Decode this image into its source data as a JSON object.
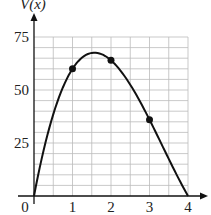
{
  "chart_data": {
    "type": "line",
    "title": "",
    "xlabel": "",
    "ylabel": "V(x)",
    "x_ticks": [
      "0",
      "1",
      "2",
      "3",
      "4"
    ],
    "y_ticks": [
      "25",
      "50",
      "75"
    ],
    "xlim": [
      0,
      4
    ],
    "ylim": [
      0,
      75
    ],
    "grid": true,
    "grid_x_step": 0.5,
    "grid_y_step": 5,
    "series": [
      {
        "name": "V(x)",
        "x": [
          0,
          0.5,
          1,
          1.5,
          2,
          2.5,
          3,
          3.5,
          4
        ],
        "values": [
          0,
          38.5,
          60,
          67.5,
          64,
          52.5,
          36,
          17.5,
          0
        ]
      }
    ],
    "marked_points": [
      {
        "x": 1,
        "y": 60
      },
      {
        "x": 2,
        "y": 64
      },
      {
        "x": 3,
        "y": 36
      }
    ]
  }
}
